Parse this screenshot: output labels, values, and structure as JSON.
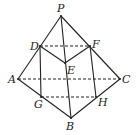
{
  "diagram": {
    "type": "geometry-solid",
    "stroke_color": "#222222",
    "points": {
      "P": {
        "label": "P",
        "x": 61,
        "y": 16,
        "lx": 57,
        "ly": 12
      },
      "D": {
        "label": "D",
        "x": 40,
        "y": 46,
        "lx": 30,
        "ly": 50
      },
      "F": {
        "label": "F",
        "x": 90,
        "y": 46,
        "lx": 92,
        "ly": 48
      },
      "E": {
        "label": "E",
        "x": 65,
        "y": 63,
        "lx": 67,
        "ly": 74
      },
      "A": {
        "label": "A",
        "x": 18,
        "y": 79,
        "lx": 8,
        "ly": 83
      },
      "C": {
        "label": "C",
        "x": 120,
        "y": 79,
        "lx": 122,
        "ly": 83
      },
      "G": {
        "label": "G",
        "x": 41,
        "y": 97,
        "lx": 34,
        "ly": 108
      },
      "H": {
        "label": "H",
        "x": 96,
        "y": 97,
        "lx": 98,
        "ly": 106
      },
      "B": {
        "label": "B",
        "x": 71,
        "y": 118,
        "lx": 66,
        "ly": 130
      }
    },
    "solid_edges": [
      [
        "P",
        "A"
      ],
      [
        "P",
        "C"
      ],
      [
        "P",
        "B"
      ],
      [
        "A",
        "B"
      ],
      [
        "B",
        "C"
      ],
      [
        "D",
        "E"
      ],
      [
        "E",
        "F"
      ],
      [
        "D",
        "G"
      ],
      [
        "F",
        "H"
      ]
    ],
    "dashed_edges": [
      [
        "D",
        "F"
      ],
      [
        "A",
        "C"
      ],
      [
        "G",
        "H"
      ]
    ]
  }
}
